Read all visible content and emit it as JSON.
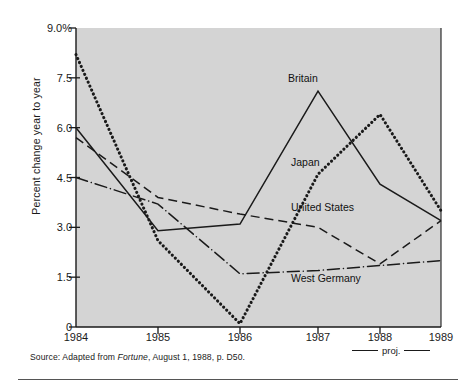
{
  "chart_data": {
    "type": "line",
    "title": "",
    "xlabel": "",
    "ylabel": "Percent change year to year",
    "x": [
      "1984",
      "1985",
      "1986",
      "1987",
      "1988",
      "1989"
    ],
    "xlim": [
      1984,
      1989
    ],
    "ylim": [
      0,
      9.0
    ],
    "yticks": [
      "0",
      "1.5",
      "3.0",
      "4.5",
      "6.0",
      "7.5",
      "9.0%"
    ],
    "ytick_values": [
      0,
      1.5,
      3.0,
      4.5,
      6.0,
      7.5,
      9.0
    ],
    "grid": false,
    "legend": "inline-labels",
    "series": [
      {
        "name": "Britain",
        "style": "solid",
        "values": [
          6.0,
          2.9,
          3.1,
          7.1,
          4.3,
          3.2
        ]
      },
      {
        "name": "Japan",
        "style": "dotted",
        "values": [
          8.2,
          2.6,
          0.1,
          4.6,
          6.4,
          3.5
        ]
      },
      {
        "name": "United States",
        "style": "dashed",
        "values": [
          5.7,
          3.9,
          3.4,
          3.0,
          1.9,
          3.2
        ]
      },
      {
        "name": "West Germany",
        "style": "dash-dot",
        "values": [
          4.5,
          3.7,
          1.6,
          1.7,
          1.85,
          2.0
        ]
      }
    ],
    "annotations": [
      {
        "text": "Britain",
        "x": 1987,
        "y": 7.85
      },
      {
        "text": "Japan",
        "x": 1987.1,
        "y": 4.55
      },
      {
        "text": "United States",
        "x": 1987.1,
        "y": 3.25
      },
      {
        "text": "West Germany",
        "x": 1987.1,
        "y": 1.15
      },
      {
        "text": "proj.",
        "x": 1988.5,
        "y": -0.8
      }
    ]
  },
  "caption": {
    "source_prefix": "Source: Adapted from ",
    "source_italic": "Fortune",
    "source_suffix": ", August 1, 1988, p. D50."
  },
  "projection": {
    "label": "proj."
  },
  "colors": {
    "plot_background": "#d4d4d4",
    "axis": "#1a1a1a",
    "ink": "#1a1a1a",
    "page": "#ffffff"
  }
}
